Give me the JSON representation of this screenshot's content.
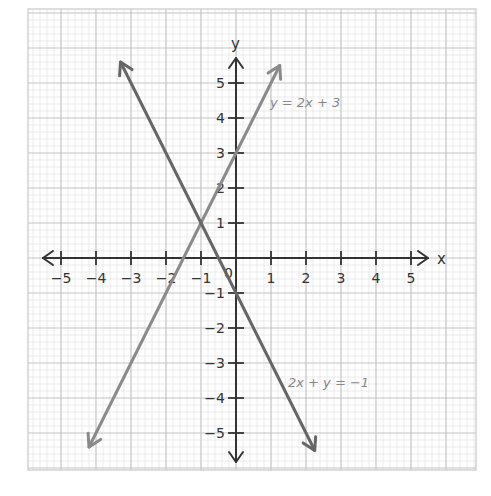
{
  "chart_data": {
    "type": "line",
    "title": "",
    "xlabel": "x",
    "ylabel": "y",
    "xlim": [
      -5.5,
      5.5
    ],
    "ylim": [
      -5.5,
      5.5
    ],
    "grid": true,
    "legend": "none (inline labels)",
    "x_ticks": [
      -5,
      -4,
      -3,
      -2,
      -1,
      1,
      2,
      3,
      4,
      5
    ],
    "y_ticks": [
      -5,
      -4,
      -3,
      -2,
      -1,
      1,
      2,
      3,
      4,
      5
    ],
    "origin_label": "0",
    "series": [
      {
        "name": "y = 2x + 3",
        "equation": "y = 2x + 3",
        "x": [
          -4.2,
          1.25
        ],
        "y": [
          -5.4,
          5.5
        ],
        "arrows": "both",
        "color": "#8a8a8a",
        "label_position": [
          1.2,
          4.5
        ]
      },
      {
        "name": "2x + y = −1",
        "equation": "2x + y = -1",
        "x": [
          -3.3,
          2.25
        ],
        "y": [
          5.6,
          -5.5
        ],
        "arrows": "both",
        "color": "#666666",
        "label_position": [
          1.5,
          -3.6
        ]
      }
    ],
    "intersection": {
      "x": -1,
      "y": 1
    },
    "annotations": [
      "y = 2x + 3",
      "2x + y = −1"
    ]
  },
  "labels": {
    "x_axis": "x",
    "y_axis": "y",
    "origin": "0",
    "line1": "y = 2x + 3",
    "line2": "2x + y = −1"
  }
}
